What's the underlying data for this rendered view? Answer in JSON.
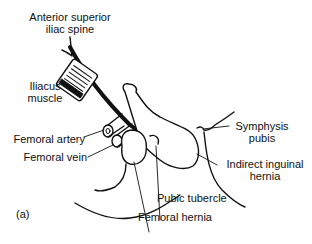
{
  "figure": {
    "panel_label": "(a)",
    "colors": {
      "ink": "#111111",
      "background": "#ffffff"
    },
    "labels": {
      "asis_line1": "Anterior superior",
      "asis_line2": "iliac spine",
      "iliacus_line1": "Iliacus",
      "iliacus_line2": "muscle",
      "femoral_artery": "Femoral artery",
      "femoral_vein": "Femoral vein",
      "symphysis_line1": "Symphysis",
      "symphysis_line2": "pubis",
      "indirect_line1": "Indirect inguinal",
      "indirect_line2": "hernia",
      "pubic_tubercle": "Pubic tubercle",
      "femoral_hernia": "Femoral hernia"
    }
  }
}
